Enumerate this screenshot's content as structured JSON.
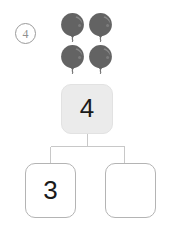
{
  "worksheet": {
    "problem_number": "4",
    "problem_badge_icon": "circled-number-icon",
    "background_color": "#ffffff"
  },
  "manipulatives": {
    "icon": "balloon-icon",
    "count": 4,
    "rows": 2,
    "columns": 2,
    "fill_color": "#636363",
    "highlight_color": "#8e8e8e",
    "items": [
      {
        "label": "balloon-1"
      },
      {
        "label": "balloon-2"
      },
      {
        "label": "balloon-3"
      },
      {
        "label": "balloon-4"
      }
    ]
  },
  "number_bond": {
    "total": {
      "label": "4",
      "fill_color": "#ebebeb",
      "border_color": "#e2e2e2",
      "filled": true
    },
    "parts": [
      {
        "label": "3",
        "fill_color": "#ffffff",
        "border_color": "#b4b4b4",
        "filled": true
      },
      {
        "label": "",
        "fill_color": "#ffffff",
        "border_color": "#b4b4b4",
        "filled": false
      }
    ],
    "connector_color": "#c8c8c8"
  }
}
